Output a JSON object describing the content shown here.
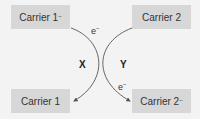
{
  "diagram": {
    "boxes": {
      "top_left": {
        "base": "Carrier 1",
        "charge": "−"
      },
      "top_right": {
        "base": "Carrier 2",
        "charge": ""
      },
      "bottom_left": {
        "base": "Carrier 1",
        "charge": ""
      },
      "bottom_right": {
        "base": "Carrier 2",
        "charge": "−"
      }
    },
    "arrows": {
      "x": {
        "label": "X",
        "electron_base": "e",
        "electron_charge": "−",
        "from": "Carrier 1−",
        "to": "Carrier 1"
      },
      "y": {
        "label": "Y",
        "electron_base": "e",
        "electron_charge": "−",
        "from": "Carrier 2",
        "to": "Carrier 2−"
      }
    },
    "colors": {
      "background": "#f3f3f3",
      "box_fill": "#d7d7d7",
      "text": "#333333",
      "arrow": "#555555"
    }
  }
}
